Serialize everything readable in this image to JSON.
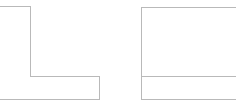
{
  "canvas": {
    "width": 236,
    "height": 109,
    "background_color": "#ffffff",
    "stroke_color": "#b9b9b9",
    "fill_color": "#ffffff",
    "stroke_width": 1
  },
  "figure": {
    "title": "",
    "shape_count": 2
  },
  "shapes": [
    {
      "id": "left-shape",
      "name": "l-shaped-polygon",
      "kind": "polygon",
      "clipped_edges": [
        "left"
      ],
      "points": "-8,6 30,6 30,76 99,76 99,99 -8,99",
      "bounds": {
        "x": -8,
        "y": 6,
        "width": 107,
        "height": 93
      },
      "label": "L-shape"
    },
    {
      "id": "right-shape",
      "name": "divided-rectangle",
      "kind": "rect",
      "clipped_edges": [
        "right"
      ],
      "points": "141,7 244,7 244,99 141,99",
      "bounds": {
        "x": 141,
        "y": 7,
        "width": 103,
        "height": 92
      },
      "label": "Rectangle with divider"
    }
  ],
  "divider": {
    "name": "horizontal-divider",
    "x1": 141,
    "y1": 76,
    "x2": 244,
    "y2": 76,
    "label": "Horizontal divider line"
  }
}
